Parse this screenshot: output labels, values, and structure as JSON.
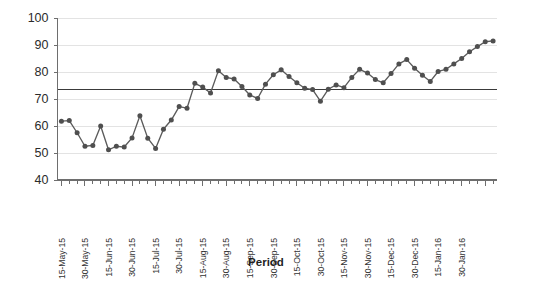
{
  "chart_data": {
    "type": "line",
    "title": "",
    "xlabel": "Period",
    "ylabel": "",
    "ylim": [
      40,
      100
    ],
    "yticks": [
      40,
      50,
      60,
      70,
      80,
      90,
      100
    ],
    "grid": true,
    "legend": "none",
    "x_tick_labels": [
      "15-May-15",
      "30-May-15",
      "15-Jun-15",
      "30-Jun-15",
      "15-Jul-15",
      "30-Jul-15",
      "15-Aug-15",
      "30-Aug-15",
      "15-Sep-15",
      "30-Sep-15",
      "15-Oct-15",
      "30-Oct-15",
      "15-Nov-15",
      "30-Nov-15",
      "15-Dec-15",
      "30-Dec-15",
      "15-Jan-16",
      "30-Jan-16"
    ],
    "x_label_interval": 3,
    "series": [
      {
        "name": "Value",
        "marker": "circle",
        "color": "#4f4f4f",
        "values": [
          61.8,
          62.0,
          57.5,
          52.5,
          52.8,
          60.0,
          51.2,
          52.5,
          52.2,
          55.6,
          63.8,
          55.5,
          51.7,
          58.8,
          62.2,
          67.2,
          66.6,
          75.8,
          74.4,
          72.2,
          80.5,
          78.0,
          77.4,
          74.6,
          71.5,
          70.2,
          75.5,
          79.0,
          80.8,
          78.3,
          76.0,
          74.0,
          73.5,
          69.2,
          73.6,
          75.2,
          74.2,
          78.0,
          81.0,
          79.6,
          77.2,
          76.0,
          79.4,
          83.0,
          84.6,
          81.4,
          78.8,
          76.5,
          80.2,
          81.0,
          83.0,
          85.0,
          87.5,
          89.4,
          91.2,
          91.5
        ]
      }
    ],
    "reference_lines": [
      {
        "name": "mean-line",
        "value": 73.5,
        "color": "#3a3a3a"
      }
    ]
  },
  "axis": {
    "y_min_label": "40",
    "y_max_label": "100"
  }
}
